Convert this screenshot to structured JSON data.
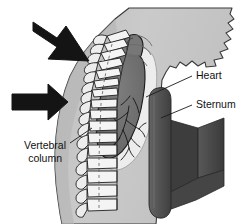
{
  "figure": {
    "kind": "anatomical-diagram",
    "view": "sagittal-lateral",
    "background_color": "#ffffff"
  },
  "colors": {
    "background": "#ffffff",
    "body_fill": "#c8c8c8",
    "body_fill_shadow": "#b0b0b0",
    "body_outline": "#3a3a3a",
    "vertebra_fill": "#f2f2f2",
    "vertebra_outline": "#1f1f1f",
    "heart_fill": "#6e6e6e",
    "heart_outline": "#1a1a1a",
    "vessel_stroke": "#1a1a1a",
    "lung_cavity_fill": "#efefef",
    "sternum_fill": "#4a4a4a",
    "sternum_fill_dark": "#3b3b3b",
    "sternum_fill_light": "#5a5a5a",
    "sternum_column": "#555555",
    "arrow_fill": "#141414",
    "leader_line": "#1a1a1a",
    "text": "#111111"
  },
  "labels": [
    {
      "id": "heart",
      "name": "Heart",
      "lines": [
        "Heart"
      ],
      "text_x": 196,
      "text_y": 76,
      "anchor": "start",
      "leader": {
        "x1": 192,
        "y1": 76,
        "x2": 146,
        "y2": 97
      }
    },
    {
      "id": "sternum",
      "name": "Sternum",
      "lines": [
        "Sternum"
      ],
      "text_x": 196,
      "text_y": 105,
      "anchor": "start",
      "leader": {
        "x1": 192,
        "y1": 105,
        "x2": 161,
        "y2": 118
      }
    },
    {
      "id": "vertebral-column",
      "name": "Vertebral column",
      "lines": [
        "Vertebral",
        "column"
      ],
      "text_x": 66,
      "text_y": 146,
      "anchor": "end",
      "leader": {
        "x1": 70,
        "y1": 143,
        "x2": 92,
        "y2": 128
      }
    }
  ],
  "arrows": [
    {
      "id": "upper-compression-arrow",
      "name": "compression-arrow-upper",
      "direction": "down-right",
      "angle_deg": 37,
      "tip_x": 89,
      "tip_y": 61,
      "tail_x": 33,
      "tail_y": 27
    },
    {
      "id": "lower-compression-arrow",
      "name": "compression-arrow-lower",
      "direction": "right",
      "angle_deg": 0,
      "tip_x": 68,
      "tip_y": 102,
      "tail_x": 12,
      "tail_y": 102
    }
  ],
  "structures": [
    {
      "id": "body-silhouette",
      "name": "body-torso-silhouette"
    },
    {
      "id": "vertebral-column",
      "name": "vertebral-column",
      "vertebra_count": 14
    },
    {
      "id": "heart",
      "name": "heart-mass"
    },
    {
      "id": "coronary-vessels",
      "name": "coronary-vessels"
    },
    {
      "id": "sternum",
      "name": "sternum-slab"
    },
    {
      "id": "spinal-canal-line",
      "name": "spinal-canal-dashed-line"
    }
  ]
}
